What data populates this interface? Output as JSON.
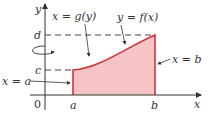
{
  "diagram": {
    "type": "region-under-curve",
    "colors": {
      "region_fill": "#f6c3c6",
      "region_edge": "#d0343a",
      "axis": "#333333",
      "dash": "#444444"
    },
    "axes": {
      "x_label": "x",
      "y_label": "y",
      "origin_label": "0"
    },
    "ticks": {
      "x_a": "a",
      "x_b": "b",
      "y_c": "c",
      "y_d": "d"
    },
    "annotations": {
      "g_curve": "x = g(y)",
      "f_curve": "y = f(x)",
      "line_b": "x = b",
      "line_a": "x = a"
    },
    "rotation_axis": "y-axis"
  }
}
